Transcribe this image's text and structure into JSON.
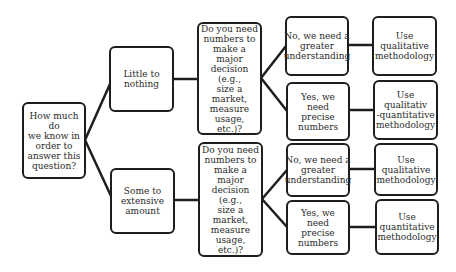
{
  "diagram": {
    "type": "decision-tree",
    "root": {
      "text": "How much do\nwe know in\norder to\nanswer this\nquestion?"
    },
    "branches": [
      {
        "label": "Little to\nnothing",
        "question": "Do you need\nnumbers to\nmake a major\ndecision (e.g.,\nsize a market,\nmeasure\nusage, etc.)?",
        "answers": [
          {
            "answer": "No, we need a\ngreater\nunderstanding",
            "outcome": "Use qualitative\nmethodology"
          },
          {
            "answer": "Yes, we need\nprecise\nnumbers",
            "outcome": "Use qualitativ\n-quantitative\nmethodology"
          }
        ]
      },
      {
        "label": "Some to\nextensive\namount",
        "question": "Do you need\nnumbers to\nmake a major\ndecision (e.g.,\nsize a market,\nmeasure\nusage, etc.)?",
        "answers": [
          {
            "answer": "No, we need a\ngreater\nunderstanding",
            "outcome": "Use qualitative\nmethodology"
          },
          {
            "answer": "Yes, we need\nprecise\nnumbers",
            "outcome": "Use\nquantitative\nmethodology"
          }
        ]
      }
    ],
    "colors": {
      "border": "#1e1e1e",
      "text": "#2b2b2b",
      "background": "#ffffff"
    }
  }
}
